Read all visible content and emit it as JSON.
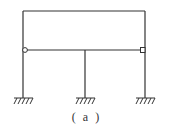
{
  "figure": {
    "caption": "( a )",
    "line_color": "#333333",
    "background": "#ffffff"
  },
  "frame": {
    "top_beam": {
      "x1": 23,
      "x2": 145,
      "y": 11
    },
    "middle_beam": {
      "x1": 23,
      "x2": 145,
      "y": 50
    },
    "columns": [
      {
        "name": "left",
        "x": 23,
        "y1": 11,
        "y2": 98
      },
      {
        "name": "middle",
        "x": 85,
        "y1": 50,
        "y2": 98
      },
      {
        "name": "right",
        "x": 145,
        "y1": 11,
        "y2": 98
      }
    ],
    "hinges": [
      {
        "name": "left",
        "type": "circle",
        "x": 25,
        "y": 50
      },
      {
        "name": "right",
        "type": "box",
        "x": 143,
        "y": 50
      }
    ],
    "fixed_supports": [
      {
        "name": "left",
        "x": 23,
        "y": 98
      },
      {
        "name": "middle",
        "x": 85,
        "y": 98
      },
      {
        "name": "right",
        "x": 145,
        "y": 98
      }
    ]
  }
}
